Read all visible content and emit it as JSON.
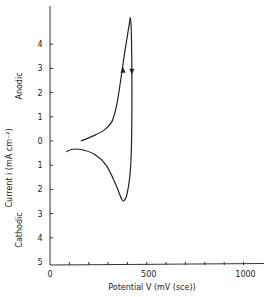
{
  "chart_data": {
    "type": "line",
    "title": "",
    "xlabel": "Potential V (mV (sce))",
    "ylabel": "Current i (mA cm⁻²)",
    "ylabel_upper": "Anodic",
    "ylabel_lower": "Cathodic",
    "xlim": [
      0,
      1100
    ],
    "ylim": [
      -5,
      5.5
    ],
    "x_ticks": [
      100,
      200,
      300,
      400,
      500,
      600,
      700,
      800,
      900,
      1000
    ],
    "x_tick_labels": [
      {
        "value": 0,
        "label": "0"
      },
      {
        "value": 500,
        "label": "500"
      },
      {
        "value": 1000,
        "label": "1000"
      }
    ],
    "y_tick_labels": [
      {
        "value": 4,
        "label": "4"
      },
      {
        "value": 3,
        "label": "3"
      },
      {
        "value": 2,
        "label": "2"
      },
      {
        "value": 1,
        "label": "1"
      },
      {
        "value": 0,
        "label": "0"
      },
      {
        "value": -1,
        "label": "1"
      },
      {
        "value": -2,
        "label": "2"
      },
      {
        "value": -3,
        "label": "3"
      },
      {
        "value": -4,
        "label": "4"
      },
      {
        "value": -5,
        "label": "5"
      }
    ],
    "grid": false,
    "legend": null,
    "series": [
      {
        "name": "anodic-sweep",
        "points": [
          [
            160,
            0
          ],
          [
            220,
            0.2
          ],
          [
            280,
            0.45
          ],
          [
            320,
            0.8
          ],
          [
            345,
            1.5
          ],
          [
            365,
            2.5
          ],
          [
            385,
            3.6
          ],
          [
            405,
            4.6
          ],
          [
            415,
            5.1
          ]
        ]
      },
      {
        "name": "return-sweep",
        "points": [
          [
            415,
            5.1
          ],
          [
            420,
            4.6
          ],
          [
            423,
            3.0
          ],
          [
            423,
            1.0
          ],
          [
            420,
            -0.5
          ],
          [
            412,
            -1.5
          ],
          [
            398,
            -2.2
          ],
          [
            385,
            -2.45
          ],
          [
            370,
            -2.4
          ],
          [
            340,
            -1.8
          ],
          [
            290,
            -1.0
          ],
          [
            230,
            -0.55
          ],
          [
            160,
            -0.35
          ],
          [
            110,
            -0.35
          ],
          [
            85,
            -0.45
          ]
        ]
      }
    ],
    "arrows": [
      {
        "series": "anodic-sweep",
        "at": [
          377,
          2.9
        ],
        "direction": "up"
      },
      {
        "series": "return-sweep",
        "at": [
          423,
          2.9
        ],
        "direction": "down"
      }
    ]
  }
}
